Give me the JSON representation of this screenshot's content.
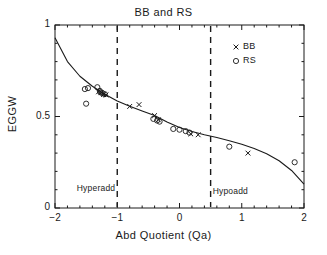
{
  "chart_data": {
    "type": "scatter",
    "title": "BB and RS",
    "xlabel": "Abd Quotient (Qa)",
    "ylabel": "EGGW",
    "xlim": [
      -2,
      2
    ],
    "ylim": [
      0,
      1
    ],
    "xticks": [
      -2,
      -1,
      0,
      1,
      2
    ],
    "xticklabels": [
      "−2",
      "−1",
      "0",
      "1",
      "2"
    ],
    "yticks": [
      0,
      0.5,
      1
    ],
    "yticklabels": [
      "0",
      "0.5",
      "1"
    ],
    "grid": false,
    "legend_position": "top-right",
    "series": [
      {
        "name": "BB",
        "marker": "x",
        "points": [
          [
            -1.3,
            0.635
          ],
          [
            -1.26,
            0.63
          ],
          [
            -1.22,
            0.62
          ],
          [
            -1.18,
            0.618
          ],
          [
            -0.8,
            0.555
          ],
          [
            -0.65,
            0.565
          ],
          [
            -0.4,
            0.505
          ],
          [
            -0.34,
            0.482
          ],
          [
            0.18,
            0.405
          ],
          [
            0.3,
            0.4
          ],
          [
            1.1,
            0.3
          ]
        ]
      },
      {
        "name": "RS",
        "marker": "o",
        "points": [
          [
            -1.52,
            0.65
          ],
          [
            -1.47,
            0.655
          ],
          [
            -1.5,
            0.57
          ],
          [
            -1.32,
            0.66
          ],
          [
            -1.28,
            0.64
          ],
          [
            -1.27,
            0.632
          ],
          [
            -1.24,
            0.628
          ],
          [
            -1.2,
            0.622
          ],
          [
            -0.42,
            0.487
          ],
          [
            -0.36,
            0.478
          ],
          [
            -0.32,
            0.472
          ],
          [
            -0.1,
            0.432
          ],
          [
            0.0,
            0.428
          ],
          [
            0.1,
            0.42
          ],
          [
            0.16,
            0.412
          ],
          [
            0.8,
            0.335
          ],
          [
            1.85,
            0.25
          ]
        ]
      }
    ],
    "fit_curve": {
      "name": "fitted curve",
      "points": [
        [
          -2.0,
          0.93
        ],
        [
          -1.8,
          0.8
        ],
        [
          -1.6,
          0.72
        ],
        [
          -1.4,
          0.665
        ],
        [
          -1.2,
          0.622
        ],
        [
          -1.0,
          0.585
        ],
        [
          -0.8,
          0.556
        ],
        [
          -0.6,
          0.53
        ],
        [
          -0.4,
          0.505
        ],
        [
          -0.2,
          0.47
        ],
        [
          0.0,
          0.44
        ],
        [
          0.2,
          0.418
        ],
        [
          0.4,
          0.4
        ],
        [
          0.6,
          0.385
        ],
        [
          0.8,
          0.368
        ],
        [
          1.0,
          0.348
        ],
        [
          1.2,
          0.325
        ],
        [
          1.4,
          0.297
        ],
        [
          1.6,
          0.258
        ],
        [
          1.8,
          0.205
        ],
        [
          2.0,
          0.13
        ]
      ]
    },
    "vlines": [
      {
        "x": -1.0,
        "style": "dashed",
        "label": "Hyperadd"
      },
      {
        "x": 0.5,
        "style": "dashed",
        "label": "Hypoadd"
      }
    ],
    "annotations": [
      {
        "text": "Hyperadd",
        "x": -1.0,
        "y": 0.105,
        "align": "right"
      },
      {
        "text": "Hypoadd",
        "x": 0.5,
        "y": 0.085,
        "align": "left"
      }
    ],
    "legend": [
      {
        "label": "BB",
        "marker": "x"
      },
      {
        "label": "RS",
        "marker": "o"
      }
    ]
  },
  "colors": {
    "axis": "#1a1a1a",
    "curve": "#1a1a1a",
    "marker": "#1a1a1a",
    "background": "#ffffff"
  }
}
